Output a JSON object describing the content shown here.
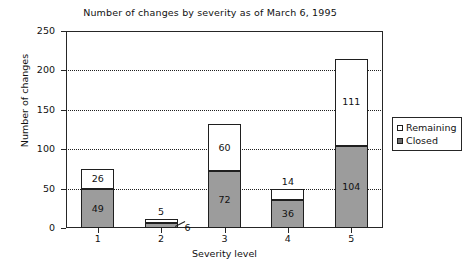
{
  "chart_data": {
    "type": "bar",
    "subtype": "stacked-bar",
    "title": "Number of changes by severity as of March 6, 1995",
    "xlabel": "Severity level",
    "ylabel": "Number of changes",
    "categories": [
      "1",
      "2",
      "3",
      "4",
      "5"
    ],
    "series": [
      {
        "name": "Closed",
        "values": [
          49,
          6,
          72,
          36,
          104
        ]
      },
      {
        "name": "Remaining",
        "values": [
          26,
          5,
          60,
          14,
          111
        ]
      }
    ],
    "totals": [
      75,
      11,
      132,
      50,
      215
    ],
    "ylim": [
      0,
      250
    ],
    "yticks": [
      0,
      50,
      100,
      150,
      200,
      250
    ],
    "ytick_labels": [
      "0",
      "50",
      "100",
      "150",
      "200",
      "250"
    ],
    "grid": "horizontal-dotted",
    "legend_position": "right",
    "legend": [
      {
        "label": "Remaining",
        "color": "#ffffff"
      },
      {
        "label": "Closed",
        "color": "#9c9c9c"
      }
    ],
    "annotations": [
      {
        "text": "6",
        "note": "leader line pointing to the Closed segment of severity level 2"
      }
    ],
    "colors": {
      "closed_fill": "#9c9c9c",
      "remaining_fill": "#ffffff",
      "outline": "#1f1f1f",
      "axis": "#262626",
      "background": "#ffffff"
    }
  }
}
